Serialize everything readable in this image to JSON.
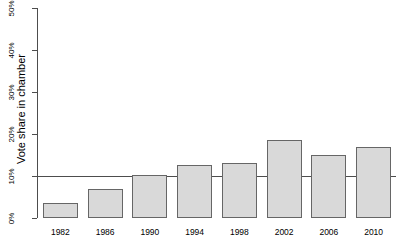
{
  "chart_data": {
    "type": "bar",
    "title": "",
    "subtitle": "",
    "xlabel": "",
    "ylabel": "Vote share in chamber",
    "categories": [
      "1982",
      "1986",
      "1990",
      "1994",
      "1998",
      "2002",
      "2006",
      "2010"
    ],
    "values": [
      3.5,
      7.0,
      10.3,
      12.7,
      13.0,
      18.5,
      15.0,
      17.0
    ],
    "value_unit": "%",
    "ylim": [
      0,
      50
    ],
    "y_ticks": [
      "0%",
      "10%",
      "20%",
      "30%",
      "40%",
      "50%"
    ],
    "y_tick_values": [
      0,
      10,
      20,
      30,
      40,
      50
    ],
    "grid": false,
    "legend": null,
    "legend_position": "none",
    "annotations": [
      {
        "name": "reference-line",
        "kind": "horizontal-line",
        "value": 10,
        "label": ""
      }
    ],
    "colors": {
      "bar_fill": "#d9d9d9",
      "bar_border": "#666666",
      "axis": "#4d4d4d",
      "reference_line": "#4d4d4d",
      "text": "#000000",
      "background": "#ffffff"
    }
  }
}
